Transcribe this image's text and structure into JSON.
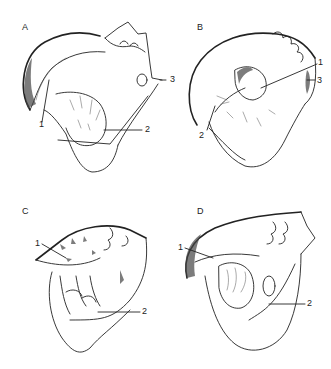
{
  "figure": {
    "panels": [
      {
        "id": "A",
        "letter": "A",
        "labels": [
          {
            "text": "1",
            "target": "structure-1"
          },
          {
            "text": "2",
            "target": "structure-2"
          },
          {
            "text": "3",
            "target": "structure-3"
          }
        ]
      },
      {
        "id": "B",
        "letter": "B",
        "labels": [
          {
            "text": "1",
            "target": "structure-1"
          },
          {
            "text": "2",
            "target": "structure-2"
          },
          {
            "text": "3",
            "target": "structure-3"
          }
        ]
      },
      {
        "id": "C",
        "letter": "C",
        "labels": [
          {
            "text": "1",
            "target": "structure-1"
          },
          {
            "text": "2",
            "target": "structure-2"
          }
        ]
      },
      {
        "id": "D",
        "letter": "D",
        "labels": [
          {
            "text": "1",
            "target": "structure-1"
          },
          {
            "text": "2",
            "target": "structure-2"
          }
        ]
      }
    ]
  }
}
